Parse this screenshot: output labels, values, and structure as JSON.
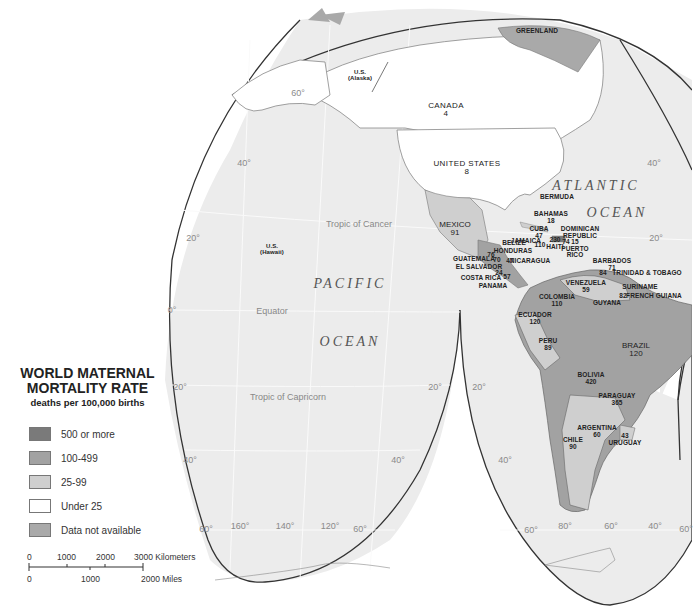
{
  "legend": {
    "title_line1": "WORLD MATERNAL",
    "title_line2": "MORTALITY RATE",
    "subtitle": "deaths per 100,000 births",
    "items": [
      {
        "label": "500 or more",
        "color": "#7a7a7a"
      },
      {
        "label": "100-499",
        "color": "#a2a2a2"
      },
      {
        "label": "25-99",
        "color": "#cfcfcf"
      },
      {
        "label": "Under 25",
        "color": "#ffffff"
      },
      {
        "label": "Data not available",
        "color": "#a9a9a9"
      }
    ]
  },
  "scale_bar": {
    "km_ticks": [
      "0",
      "1000",
      "2000",
      "3000 Kilometers"
    ],
    "mile_ticks": [
      "0",
      "1000",
      "2000 Miles"
    ]
  },
  "oceans": {
    "atlantic_1": "ATLANTIC",
    "atlantic_2": "OCEAN",
    "pacific_1": "PACIFIC",
    "pacific_2": "OCEAN"
  },
  "reference_lines": {
    "tropic_cancer": "Tropic of Cancer",
    "equator": "Equator",
    "tropic_capricorn": "Tropic of Capricorn"
  },
  "graticule_labels": {
    "lat_60_nw": "60°",
    "lat_40_w": "40°",
    "lat_20_w": "20°",
    "lat_0_w": "0°",
    "lat_s20_w": "20°",
    "lat_s40_w": "40°",
    "lat_s60_w": "60°",
    "lon_160": "160°",
    "lon_140": "140°",
    "lon_120": "120°",
    "lat_s60_m": "60°",
    "lat_s40_m": "40°",
    "lat_s20_m": "20°",
    "lat_s20_e": "20°",
    "lat_s40_e": "40°",
    "lat_s60_e": "60°",
    "lon_80": "80°",
    "lon_60": "60°",
    "lon_40": "40°",
    "lat_s60_far": "60°",
    "lat_40_e": "40°",
    "lat_20_e": "20°"
  },
  "countries": [
    {
      "name": "GREENLAND",
      "value": ""
    },
    {
      "name": "U.S.",
      "sub": "(Alaska)",
      "value": ""
    },
    {
      "name": "CANADA",
      "value": "4"
    },
    {
      "name": "UNITED STATES",
      "value": "8"
    },
    {
      "name": "U.S.",
      "sub": "(Hawaii)",
      "value": ""
    },
    {
      "name": "MEXICO",
      "value": "91"
    },
    {
      "name": "BERMUDA",
      "value": ""
    },
    {
      "name": "BAHAMAS",
      "value": "18"
    },
    {
      "name": "CUBA",
      "value": "47"
    },
    {
      "name": "JAMAICA",
      "value": "110"
    },
    {
      "name": "HAITI",
      "value": "230"
    },
    {
      "name": "DOMINICAN REPUBLIC",
      "value": "74"
    },
    {
      "name": "PUERTO RICO",
      "value": "15"
    },
    {
      "name": "BELIZE",
      "value": ""
    },
    {
      "name": "HONDURAS",
      "value": ""
    },
    {
      "name": "GUATEMALA",
      "value": "76"
    },
    {
      "name": "EL SALVADOR",
      "value": "70"
    },
    {
      "name": "NICARAGUA",
      "value": "47"
    },
    {
      "name": "COSTA RICA",
      "value": "24"
    },
    {
      "name": "PANAMA",
      "value": "57"
    },
    {
      "name": "BARBADOS",
      "value": "71"
    },
    {
      "name": "TRINIDAD & TOBAGO",
      "value": "84"
    },
    {
      "name": "VENEZUELA",
      "value": "59"
    },
    {
      "name": "SURINAME",
      "value": "82"
    },
    {
      "name": "FRENCH GUIANA",
      "value": ""
    },
    {
      "name": "GUYANA",
      "value": ""
    },
    {
      "name": "COLOMBIA",
      "value": "110"
    },
    {
      "name": "ECUADOR",
      "value": "120"
    },
    {
      "name": "PERU",
      "value": "89"
    },
    {
      "name": "BRAZIL",
      "value": "120"
    },
    {
      "name": "BOLIVIA",
      "value": "420"
    },
    {
      "name": "PARAGUAY",
      "value": "365"
    },
    {
      "name": "ARGENTINA",
      "value": "60"
    },
    {
      "name": "CHILE",
      "value": "90"
    },
    {
      "name": "URUGUAY",
      "value": "43"
    }
  ],
  "colors": {
    "ocean": "#ececec",
    "land_under25": "#ffffff",
    "land_25_99": "#cfcfcf",
    "land_100_499": "#a2a2a2",
    "border": "#555555"
  }
}
